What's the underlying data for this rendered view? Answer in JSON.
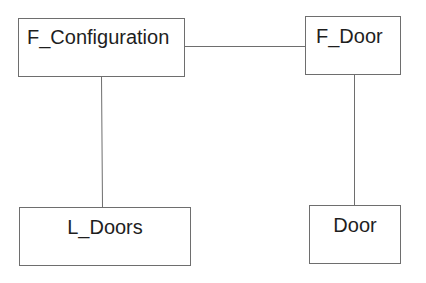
{
  "diagram": {
    "nodes": [
      {
        "id": "f_configuration",
        "label": "F_Configuration"
      },
      {
        "id": "f_door",
        "label": "F_Door"
      },
      {
        "id": "l_doors",
        "label": "L_Doors"
      },
      {
        "id": "door",
        "label": "Door"
      }
    ],
    "edges": [
      {
        "from": "f_configuration",
        "to": "f_door"
      },
      {
        "from": "f_configuration",
        "to": "l_doors"
      },
      {
        "from": "f_door",
        "to": "door"
      }
    ],
    "colors": {
      "line": "#6e6e6e",
      "text": "#1e1e1e",
      "background": "#ffffff"
    }
  }
}
